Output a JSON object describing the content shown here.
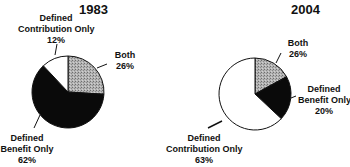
{
  "chart_data": [
    {
      "type": "pie",
      "title": "1983",
      "slices": [
        {
          "label": "Both",
          "value": 26,
          "display": "26%",
          "fill": "#a8a8a8",
          "pattern": "stipple"
        },
        {
          "label": "Defined Benefit Only",
          "value": 62,
          "display": "62%",
          "fill": "#0a0a0a"
        },
        {
          "label": "Defined Contribution Only",
          "value": 12,
          "display": "12%",
          "fill": "#ffffff"
        }
      ],
      "start_angle_deg": 0,
      "direction": "clockwise"
    },
    {
      "type": "pie",
      "title": "2004",
      "slices": [
        {
          "label": "Both",
          "value": 17,
          "display": "26%",
          "fill": "#a8a8a8",
          "pattern": "stipple"
        },
        {
          "label": "Defined Benefit Only",
          "value": 20,
          "display": "20%",
          "fill": "#0a0a0a"
        },
        {
          "label": "Defined Contribution Only",
          "value": 63,
          "display": "63%",
          "fill": "#ffffff"
        }
      ],
      "start_angle_deg": 0,
      "direction": "clockwise"
    }
  ],
  "pie1": {
    "title": "1983",
    "dc_line1": "Defined",
    "dc_line2": "Contribution Only",
    "dc_pct": "12%",
    "both_line1": "Both",
    "both_pct": "26%",
    "db_line1": "Defined",
    "db_line2": "Benefit Only",
    "db_pct": "62%"
  },
  "pie2": {
    "title": "2004",
    "both_line1": "Both",
    "both_pct": "26%",
    "db_line1": "Defined",
    "db_line2": "Benefit Only",
    "db_pct": "20%",
    "dc_line1": "Defined",
    "dc_line2": "Contribution Only",
    "dc_pct": "63%"
  }
}
